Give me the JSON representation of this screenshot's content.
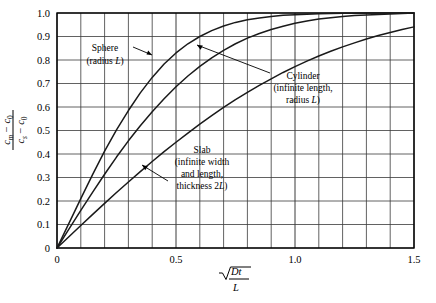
{
  "figure": {
    "background": "#ffffff",
    "frame_color": "#000000",
    "grid_color": "#3a3a3a",
    "curve_color": "#1a1a1a"
  },
  "axes": {
    "y_label": {
      "numerator": "cₘ − c₀",
      "denominator": "cₛ − c₀",
      "numerator_parts": {
        "var1": "c",
        "sub1": "m",
        "minus": "−",
        "var2": "c",
        "sub2": "0"
      },
      "denominator_parts": {
        "var1": "c",
        "sub1": "s",
        "minus": "−",
        "var2": "c",
        "sub2": "0"
      }
    },
    "x_label": {
      "numerator": "√Dt",
      "denominator": "L",
      "radicand": "Dt"
    },
    "x_ticks_major": [
      "0",
      "0.5",
      "1.0",
      "1.5"
    ],
    "x_ticks_major_values": [
      0,
      0.5,
      1.0,
      1.5
    ],
    "y_ticks": [
      "0",
      "0.1",
      "0.2",
      "0.3",
      "0.4",
      "0.5",
      "0.6",
      "0.7",
      "0.8",
      "0.9",
      "1.0"
    ],
    "y_ticks_values": [
      0,
      0.1,
      0.2,
      0.3,
      0.4,
      0.5,
      0.6,
      0.7,
      0.8,
      0.9,
      1.0
    ]
  },
  "annotations": [
    {
      "id": "sphere",
      "lines": [
        "Sphere",
        "(radius L)"
      ],
      "line1": "Sphere",
      "line2_pre": "(radius ",
      "line2_italic": "L",
      "line2_post": ")"
    },
    {
      "id": "cylinder",
      "lines": [
        "Cylinder",
        "(infinite length,",
        "radius L)"
      ],
      "line1": "Cylinder",
      "line2": "(infinite length,",
      "line3_pre": "radius ",
      "line3_italic": "L",
      "line3_post": ")"
    },
    {
      "id": "slab",
      "lines": [
        "Slab",
        "(infinite width",
        "and length,",
        "thickness 2L)"
      ],
      "line1": "Slab",
      "line2": "(infinite width",
      "line3": "and length,",
      "line4_pre": "thickness 2",
      "line4_italic": "L",
      "line4_post": ")"
    }
  ],
  "chart_data": {
    "type": "line",
    "title": "",
    "xlabel": "sqrt(Dt)/L",
    "ylabel": "(c_m - c_0)/(c_s - c_0)",
    "xlim": [
      0,
      1.5
    ],
    "ylim": [
      0,
      1.0
    ],
    "grid": true,
    "x_major_step": 0.5,
    "x_minor_step": 0.1,
    "y_major_step": 0.1,
    "legend": "inline-annotations",
    "x": [
      0,
      0.05,
      0.1,
      0.15,
      0.2,
      0.25,
      0.3,
      0.35,
      0.4,
      0.45,
      0.5,
      0.55,
      0.6,
      0.65,
      0.7,
      0.75,
      0.8,
      0.85,
      0.9,
      0.95,
      1.0,
      1.05,
      1.1,
      1.15,
      1.2,
      1.25,
      1.3,
      1.35,
      1.4,
      1.45,
      1.5
    ],
    "series": [
      {
        "name": "Sphere (radius L)",
        "values": [
          0,
          0.105,
          0.21,
          0.313,
          0.412,
          0.503,
          0.585,
          0.66,
          0.726,
          0.783,
          0.83,
          0.869,
          0.9,
          0.925,
          0.945,
          0.96,
          0.971,
          0.979,
          0.985,
          0.99,
          0.993,
          0.995,
          0.997,
          0.998,
          0.999,
          0.999,
          1.0,
          1.0,
          1.0,
          1.0,
          1.0
        ]
      },
      {
        "name": "Cylinder (infinite length, radius L)",
        "values": [
          0,
          0.08,
          0.16,
          0.238,
          0.314,
          0.387,
          0.456,
          0.52,
          0.58,
          0.635,
          0.686,
          0.732,
          0.773,
          0.809,
          0.841,
          0.869,
          0.893,
          0.913,
          0.93,
          0.944,
          0.956,
          0.966,
          0.974,
          0.98,
          0.985,
          0.989,
          0.992,
          0.994,
          0.996,
          0.998,
          1.0
        ]
      },
      {
        "name": "Slab (infinite width and length, thickness 2L)",
        "values": [
          0,
          0.048,
          0.096,
          0.143,
          0.19,
          0.236,
          0.281,
          0.325,
          0.368,
          0.41,
          0.45,
          0.489,
          0.527,
          0.563,
          0.598,
          0.631,
          0.662,
          0.692,
          0.72,
          0.747,
          0.772,
          0.795,
          0.817,
          0.837,
          0.856,
          0.873,
          0.889,
          0.904,
          0.917,
          0.93,
          0.941
        ]
      }
    ]
  }
}
